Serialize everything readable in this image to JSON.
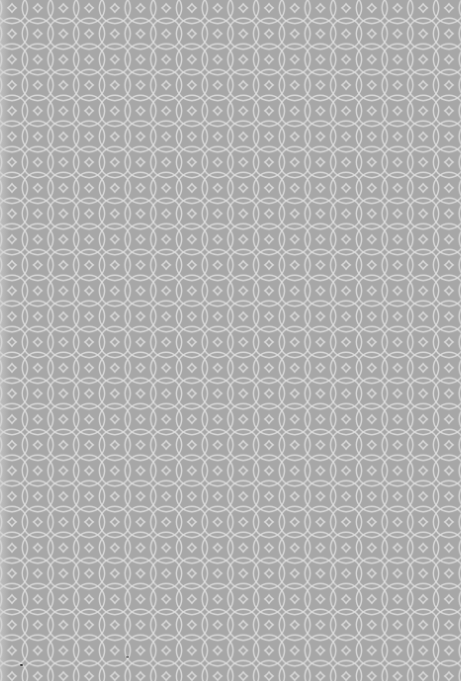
{
  "image": {
    "description": "Gray paper texture with a white interlocking circle lattice pattern",
    "background_color": "#a7a7a7",
    "line_color": "#dedede",
    "pattern": {
      "type": "overlapping-circles",
      "period_px": 25.7,
      "offset_x": 12,
      "offset_y": 8
    },
    "specks": [
      {
        "x": 21,
        "y": 665
      },
      {
        "x": 127,
        "y": 657
      }
    ]
  }
}
